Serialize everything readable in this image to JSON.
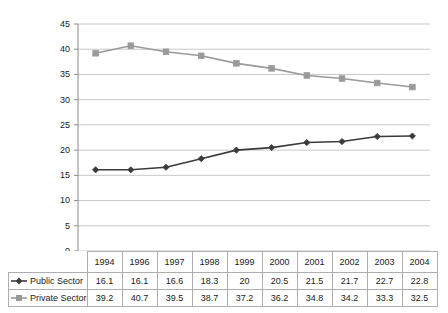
{
  "chart_data": {
    "type": "line",
    "title": "",
    "xlabel": "",
    "ylabel": "",
    "categories": [
      "1994",
      "1996",
      "1997",
      "1998",
      "1999",
      "2000",
      "2001",
      "2002",
      "2003",
      "2004"
    ],
    "series": [
      {
        "name": "Public Sector",
        "marker": "diamond",
        "color": "#3b3b3b",
        "values": [
          16.1,
          16.1,
          16.6,
          18.3,
          20,
          20.5,
          21.5,
          21.7,
          22.7,
          22.8
        ],
        "value_labels": [
          "16.1",
          "16.1",
          "16.6",
          "18.3",
          "20",
          "20.5",
          "21.5",
          "21.7",
          "22.7",
          "22.8"
        ]
      },
      {
        "name": "Private Sector",
        "marker": "square",
        "color": "#9a9a9a",
        "values": [
          39.2,
          40.7,
          39.5,
          38.7,
          37.2,
          36.2,
          34.8,
          34.2,
          33.3,
          32.5
        ],
        "value_labels": [
          "39.2",
          "40.7",
          "39.5",
          "38.7",
          "37.2",
          "36.2",
          "34.8",
          "34.2",
          "33.3",
          "32.5"
        ]
      }
    ],
    "ylim": [
      0,
      45
    ],
    "ytick_step": 5,
    "yticks": [
      "0",
      "5",
      "10",
      "15",
      "20",
      "25",
      "30",
      "35",
      "40",
      "45"
    ],
    "grid": true,
    "legend_position": "data-table-left-column",
    "gridline_color": "#c8c8c8",
    "axis_color": "#8c8c8c",
    "table_border_color": "#aeaeae",
    "background_color": "#ffffff"
  }
}
